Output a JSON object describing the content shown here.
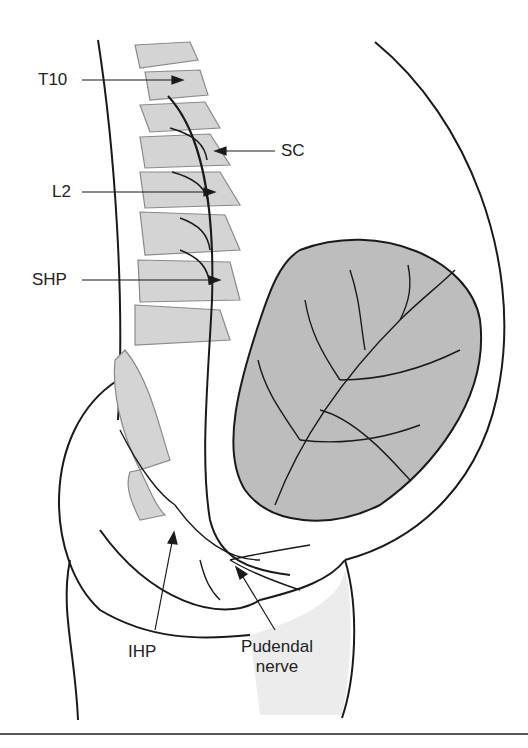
{
  "figure": {
    "labels": {
      "t10": "T10",
      "sc": "SC",
      "l2": "L2",
      "shp": "SHP",
      "ihp": "IHP",
      "pudendal_line1": "Pudendal",
      "pudendal_line2": "nerve"
    },
    "colors": {
      "bone_fill": "#d4d4d4",
      "uterus_fill": "#bdbdbd",
      "line": "#1a1a1a",
      "leg_shade": "#e6e6e6"
    }
  }
}
